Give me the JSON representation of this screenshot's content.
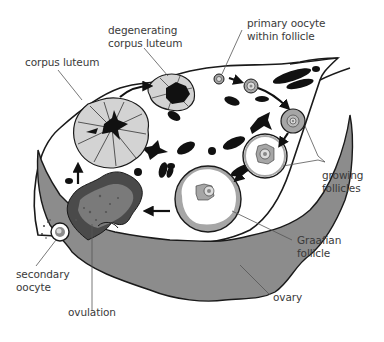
{
  "figure": {
    "colors": {
      "background": "#ffffff",
      "outline": "#1a1a1a",
      "ovary_fill": "#8c8c8c",
      "corpus_luteum_fill": "#d3d3d3",
      "follicle_fill": "#a6a6a6",
      "ovulation_dark": "#4a4a4a",
      "ovulation_mid": "#7a7a7a",
      "leader_line": "#555555",
      "label_text": "#3a3a3a"
    }
  },
  "labels": {
    "degenerating_corpus_luteum": "degenerating\ncorpus luteum",
    "corpus_luteum": "corpus luteum",
    "primary_oocyte": "primary oocyte\nwithin follicle",
    "growing_follicles": "growing\nfollicles",
    "graafian_follicle": "Graafian\nfollicle",
    "secondary_oocyte": "secondary\noocyte",
    "ovulation": "ovulation",
    "ovary": "ovary"
  }
}
